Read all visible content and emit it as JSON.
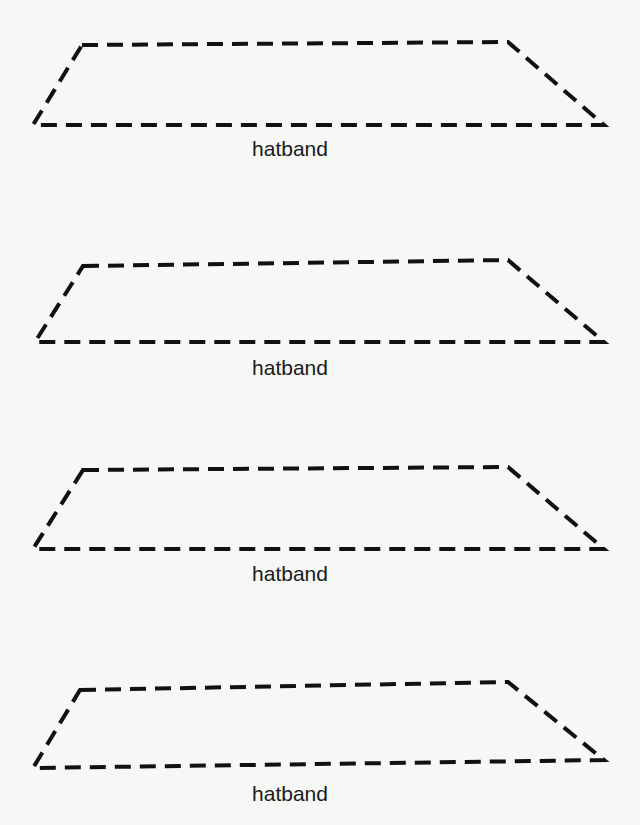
{
  "diagram": {
    "title": "",
    "shape_type": "dashed trapezoid pattern piece",
    "stroke_color": "#111111",
    "background_color": "#f7f7f5",
    "pieces": [
      {
        "label": "hatband",
        "points": "82,45 508,42 604,125 33,125",
        "label_x": 290,
        "label_y": 137
      },
      {
        "label": "hatband",
        "points": "83,266 508,260 604,342 35,342",
        "label_x": 290,
        "label_y": 356
      },
      {
        "label": "hatband",
        "points": "83,470 508,467 604,549 33,549",
        "label_x": 290,
        "label_y": 562
      },
      {
        "label": "hatband",
        "points": "80,690 508,682 604,760 33,768",
        "label_x": 290,
        "label_y": 782
      }
    ]
  }
}
